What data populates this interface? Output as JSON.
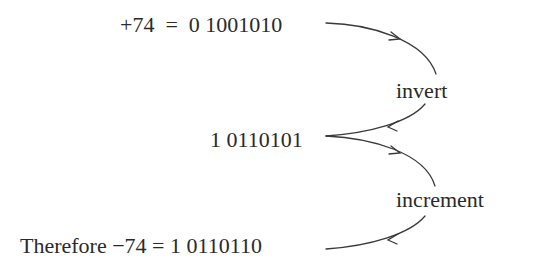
{
  "diagram": {
    "rows": [
      {
        "id": "original",
        "text": "+74  =  0 1001010"
      },
      {
        "id": "inverted",
        "text": "1 0110101"
      },
      {
        "id": "result",
        "text": "Therefore −74 = 1 0110110"
      }
    ],
    "steps": [
      {
        "id": "invert",
        "label": "invert",
        "from": "original",
        "to": "inverted"
      },
      {
        "id": "increment",
        "label": "increment",
        "from": "inverted",
        "to": "result"
      }
    ],
    "colors": {
      "text": "#2a2a2a",
      "arrow": "#3a3a3a",
      "background": "#ffffff"
    }
  }
}
